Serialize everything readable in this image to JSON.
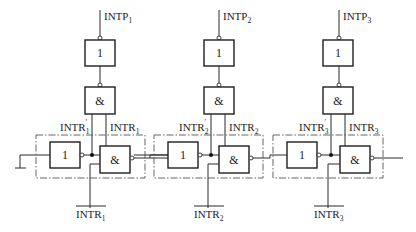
{
  "diagram": {
    "type": "daisy-chain interrupt priority logic",
    "stages": [
      {
        "index": 1,
        "input_label": "INTP",
        "input_sub": "1",
        "upper_gate_label": "1",
        "mid_gate_label": "&",
        "left_out_label": "INTR",
        "left_out_sub": "1",
        "left_out_prime": "′",
        "right_out_label": "INTR",
        "right_out_sub": "1",
        "not_gate_label": "1",
        "and_gate_label": "&",
        "bottom_label": "INTR",
        "bottom_sub": "1"
      },
      {
        "index": 2,
        "input_label": "INTP",
        "input_sub": "2",
        "upper_gate_label": "1",
        "mid_gate_label": "&",
        "left_out_label": "INTR",
        "left_out_sub": "2",
        "left_out_prime": "′",
        "right_out_label": "INTR",
        "right_out_sub": "2",
        "not_gate_label": "1",
        "and_gate_label": "&",
        "bottom_label": "INTR",
        "bottom_sub": "2"
      },
      {
        "index": 3,
        "input_label": "INTP",
        "input_sub": "3",
        "upper_gate_label": "1",
        "mid_gate_label": "&",
        "left_out_label": "INTR",
        "left_out_sub": "3",
        "left_out_prime": "′",
        "right_out_label": "INTR",
        "right_out_sub": "3",
        "not_gate_label": "1",
        "and_gate_label": "&",
        "bottom_label": "INTR",
        "bottom_sub": "3"
      }
    ],
    "ground_symbol": "ground-icon"
  }
}
